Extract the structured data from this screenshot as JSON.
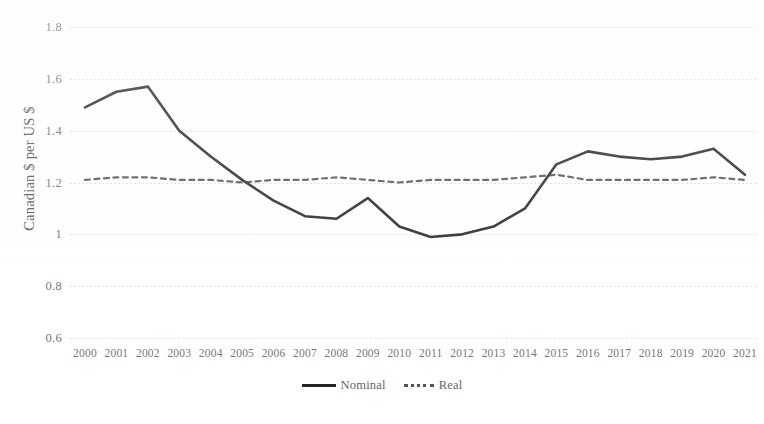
{
  "chart_data": {
    "type": "line",
    "title": "",
    "xlabel": "",
    "ylabel": "Canadian $ per US $",
    "ylim": [
      0.6,
      1.8
    ],
    "yticks": [
      "0.6",
      "0.8",
      "1",
      "1.2",
      "1.4",
      "1.6",
      "1.8"
    ],
    "ytick_values": [
      0.6,
      0.8,
      1.0,
      1.2,
      1.4,
      1.6,
      1.8
    ],
    "grid": true,
    "legend_position": "bottom",
    "categories": [
      "2000",
      "2001",
      "2002",
      "2003",
      "2004",
      "2005",
      "2006",
      "2007",
      "2008",
      "2009",
      "2010",
      "2011",
      "2012",
      "2013",
      "2014",
      "2015",
      "2016",
      "2017",
      "2018",
      "2019",
      "2020",
      "2021"
    ],
    "series": [
      {
        "name": "Nominal",
        "style": "solid",
        "color": "#1d1d1d",
        "values": [
          1.49,
          1.55,
          1.57,
          1.4,
          1.3,
          1.21,
          1.13,
          1.07,
          1.06,
          1.14,
          1.03,
          0.99,
          1.0,
          1.03,
          1.1,
          1.27,
          1.32,
          1.3,
          1.29,
          1.3,
          1.33,
          1.23
        ]
      },
      {
        "name": "Real",
        "style": "dotted",
        "color": "#4e4e4e",
        "values": [
          1.21,
          1.22,
          1.22,
          1.21,
          1.21,
          1.2,
          1.21,
          1.21,
          1.22,
          1.21,
          1.2,
          1.21,
          1.21,
          1.21,
          1.22,
          1.23,
          1.21,
          1.21,
          1.21,
          1.21,
          1.22,
          1.21
        ]
      }
    ]
  },
  "legend": {
    "entries": [
      {
        "label": "Nominal"
      },
      {
        "label": "Real"
      }
    ]
  }
}
